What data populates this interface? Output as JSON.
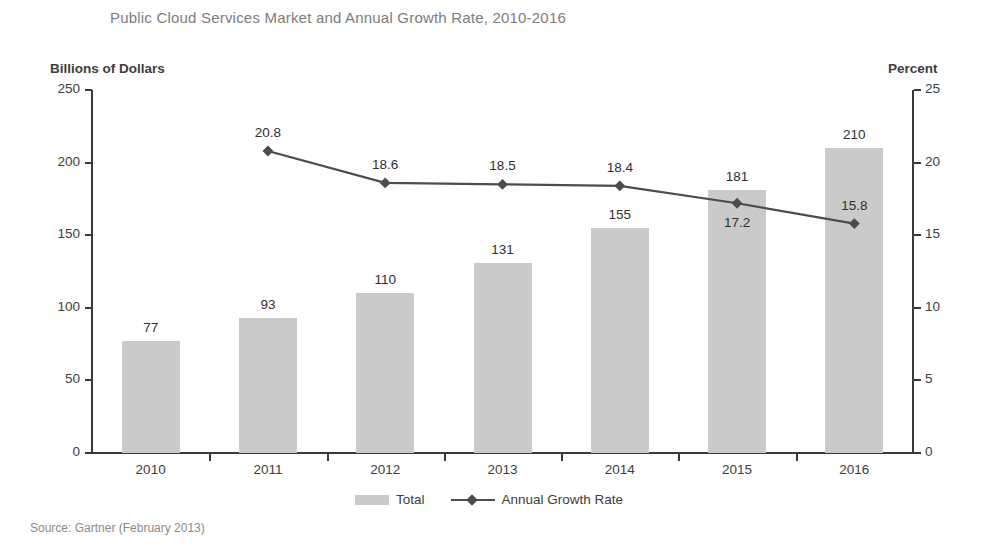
{
  "chart_data": {
    "type": "bar",
    "title": "Public Cloud Services Market and Annual Growth Rate, 2010-2016",
    "categories": [
      "2010",
      "2011",
      "2012",
      "2013",
      "2014",
      "2015",
      "2016"
    ],
    "xlabel": "",
    "ylabel": "Billions of Dollars",
    "y2label": "Percent",
    "ylim": [
      0,
      250
    ],
    "y2lim": [
      0,
      25
    ],
    "yticks": [
      "0",
      "50",
      "100",
      "150",
      "200",
      "250"
    ],
    "ytick_values": [
      0,
      50,
      100,
      150,
      200,
      250
    ],
    "y2ticks": [
      "0",
      "5",
      "10",
      "15",
      "20",
      "25"
    ],
    "y2tick_values": [
      0,
      5,
      10,
      15,
      20,
      25
    ],
    "grid": false,
    "legend_position": "bottom",
    "series": [
      {
        "name": "Total",
        "type": "bar",
        "axis": "left",
        "color": "#cacaca",
        "values": [
          77,
          93,
          110,
          131,
          155,
          181,
          210
        ],
        "labels": [
          "77",
          "93",
          "110",
          "131",
          "155",
          "181",
          "210"
        ]
      },
      {
        "name": "Annual Growth Rate",
        "type": "line",
        "axis": "right",
        "color": "#4c4c4c",
        "values": [
          null,
          20.8,
          18.6,
          18.5,
          18.4,
          17.2,
          15.8
        ],
        "labels": [
          "",
          "20.8",
          "18.6",
          "18.5",
          "18.4",
          "17.2",
          "15.8"
        ]
      }
    ],
    "source": "Source: Gartner (February 2013)"
  },
  "labels": {
    "title": "Public Cloud Services Market and Annual Growth Rate, 2010-2016",
    "left_axis_title": "Billions of Dollars",
    "right_axis_title": "Percent",
    "source": "Source: Gartner (February 2013)",
    "legend_total": "Total",
    "legend_growth": "Annual Growth Rate"
  },
  "colors": {
    "bar": "#cacaca",
    "line": "#4c4c4c",
    "axis": "#3a3a3a",
    "title": "#7d7d7d",
    "text": "#3d3d3d"
  }
}
